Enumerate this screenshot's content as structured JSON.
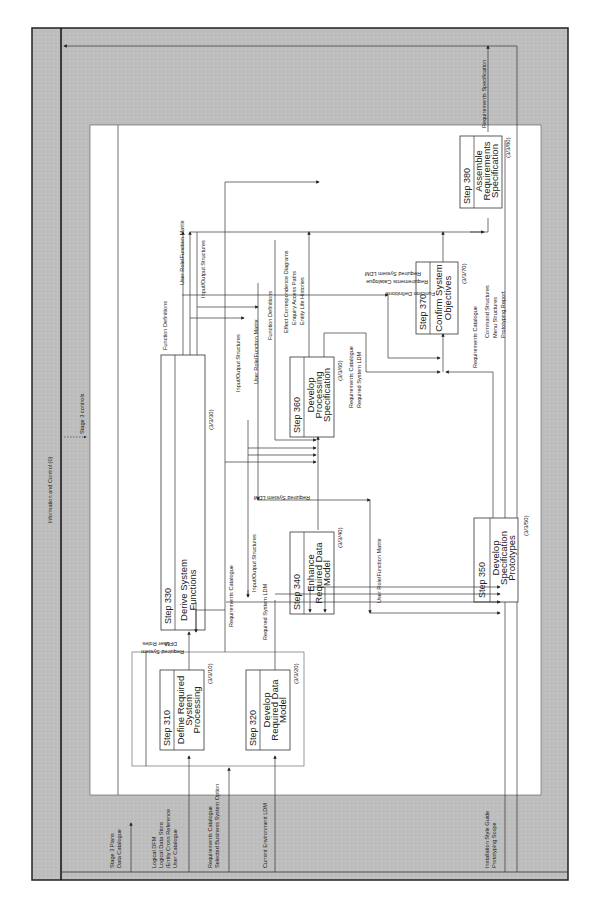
{
  "diagram": {
    "frame_title": "Information and Control (0)",
    "stage_controls": "Stage 3 controls",
    "colors": {
      "frame_fill": "#bdbdbd",
      "inner_fill": "#ffffff",
      "line": "#333333"
    },
    "external_inputs": {
      "stage_plans": "Stage 3 Plans",
      "data_catalogue": "Data Catalogue",
      "logical_dfm": "Logical  DFM",
      "logical_data_store": "Logical Data Store",
      "entity_cross_ref": "/Entity Cross Reference",
      "user_catalogue": "User Catalogue",
      "requirements_catalogue": "Requirements Catalogue",
      "selected_bso": "Selected Business System Option",
      "current_env_ldm": "Current Environment LDM",
      "installation_style_guide": "Installation Style Guide",
      "prototyping_scope": "Prototyping Scope"
    },
    "output": {
      "requirements_specification": "Requirements Specification"
    },
    "steps": [
      {
        "id": "310",
        "step_label": "Step  310",
        "title_lines": [
          "Define Required",
          "System",
          "Processing"
        ],
        "ref": "(3/3/10)"
      },
      {
        "id": "320",
        "step_label": "Step  320",
        "title_lines": [
          "Develop",
          "Required Data",
          "Model"
        ],
        "ref": "(3/3/20)"
      },
      {
        "id": "330",
        "step_label": "Step  330",
        "title_lines": [
          "Derive System",
          "Functions"
        ],
        "ref": "(3/3/30)"
      },
      {
        "id": "340",
        "step_label": "Step  340",
        "title_lines": [
          "Enhance",
          "Required Data",
          "Model"
        ],
        "ref": "(3/3/40)"
      },
      {
        "id": "350",
        "step_label": "Step  350",
        "title_lines": [
          "Develop",
          "Specification",
          "Prototypes"
        ],
        "ref": "(3/3/50)"
      },
      {
        "id": "360",
        "step_label": "Step  360",
        "title_lines": [
          "Develop",
          "Processing",
          "Specification"
        ],
        "ref": "(3/3/60)"
      },
      {
        "id": "370",
        "step_label": "Step  370",
        "title_lines": [
          "Confirm System",
          "Objectives"
        ],
        "ref": "(3/3/70)"
      },
      {
        "id": "380",
        "step_label": "Step  380",
        "title_lines": [
          "Assemble",
          "Requirements",
          "Specification"
        ],
        "ref": "(3/3/80)"
      }
    ],
    "flows": {
      "required_system": "Required System",
      "dfm": "DFM",
      "user_roles": "User Roles",
      "required_system_ldm": "Required System LDM",
      "requirements_catalogue": "Requirements Catalogue",
      "input_output_structures": "Input/Output Structures",
      "user_role_function_matrix": "User Role/Function Matrix",
      "function_definitions": "Function Definitions",
      "effect_correspondence_diagrams": "Effect Correspondence Diagrams",
      "enquiry_access_paths": "Enquiry Access Paths",
      "entity_life_histories": "Entity Life Histories",
      "req_cat_360_a": "Requirements Catalogue",
      "req_ldm_360_b": "Required System LDM",
      "fd_370": "Function Definitions",
      "rc_370": "Requirements Catalogue",
      "rsldm_370": "Required System LDM",
      "rc_350": "Requirements Catalogue",
      "command_structures": "Command Structures",
      "menu_structures": "Menu Structures",
      "prototyping_report": "Prototyping Report"
    }
  }
}
